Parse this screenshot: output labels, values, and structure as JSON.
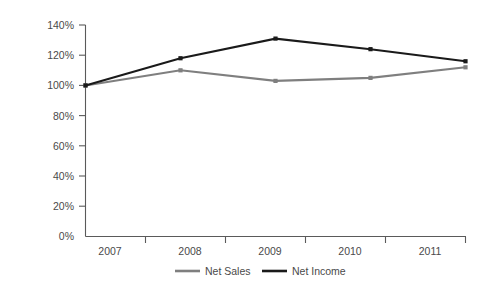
{
  "chart_data": {
    "type": "line",
    "title": "",
    "subtitle": "",
    "xlabel": "",
    "ylabel": "",
    "categories": [
      "2007",
      "2008",
      "2009",
      "2010",
      "2011"
    ],
    "x": [
      2007,
      2008,
      2009,
      2010,
      2011
    ],
    "series": [
      {
        "name": "Net Sales",
        "color": "#7f7f7f",
        "values": [
          100,
          110,
          103,
          105,
          112
        ],
        "marker": "square"
      },
      {
        "name": "Net Income",
        "color": "#1a1a1a",
        "values": [
          100,
          118,
          131,
          124,
          116
        ],
        "marker": "square"
      }
    ],
    "ylim": [
      0,
      140
    ],
    "ytick_values": [
      0,
      20,
      40,
      60,
      80,
      100,
      120,
      140
    ],
    "ytick_labels": [
      "0%",
      "20%",
      "40%",
      "60%",
      "80%",
      "100%",
      "120%",
      "140%"
    ],
    "xtick_labels": [
      "2007",
      "2008",
      "2009",
      "2010",
      "2011"
    ],
    "grid": false,
    "legend_position": "bottom",
    "legend_entries": [
      {
        "label": "Net Sales",
        "color": "#7f7f7f"
      },
      {
        "label": "Net Income",
        "color": "#1a1a1a"
      }
    ],
    "axis_color": "#5a5a5a",
    "background": "#ffffff"
  },
  "axis": {
    "y_labels": {
      "t140": "140%",
      "t120": "120%",
      "t100": "100%",
      "t80": "80%",
      "t60": "60%",
      "t40": "40%",
      "t20": "20%",
      "t0": "0%"
    },
    "x_labels": {
      "y2007": "2007",
      "y2008": "2008",
      "y2009": "2009",
      "y2010": "2010",
      "y2011": "2011"
    }
  },
  "legend": {
    "net_sales_label": "Net Sales",
    "net_income_label": "Net Income"
  }
}
